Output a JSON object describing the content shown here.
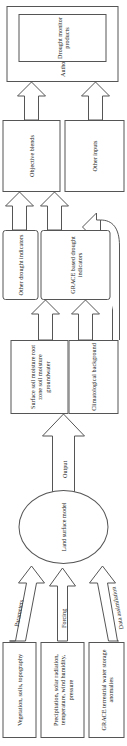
{
  "figure": {
    "type": "flowchart",
    "orientation": "bottom-to-top, rendered rotated 90 degrees",
    "background_color": "#ffffff",
    "line_color": "#555555",
    "text_color": "#1a1a1a"
  },
  "nodes": {
    "authors_container": "Authors",
    "drought_monitor_products": "Drought monitor products",
    "objective_blends": "Objective blends",
    "other_inputs": "Other inputs",
    "other_drought_indicators": "Other drought indicators",
    "grace_based_drought_indicators": "GRACE based drought indicators",
    "soil_moisture_groundwater": "Surface soil moisture root zone soil moisture groundwater",
    "climatological_background": "Climatological background",
    "land_surface_model": "Land surface model",
    "vegetation_soils_topography": "Vegetation, soils, topography",
    "meteorological_forcing": "Precipitation, solar radiation, temperature, wind humidity, pressure",
    "grace_tws_anomalies": "GRACE terrestrial water storage anomalies"
  },
  "arrow_labels": {
    "output": "Output",
    "parameters": "Parameters",
    "forcing": "Forcing",
    "data_assimilation": "Data assimilation"
  }
}
